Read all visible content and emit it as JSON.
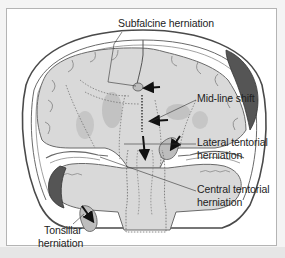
{
  "figure": {
    "type": "anatomical-diagram",
    "colors": {
      "panel_border": "#b4b4b4",
      "footer_band": "#e6e6e6",
      "brain_fill": "#d9d9d9",
      "brain_dark_fill": "#c2c2c2",
      "hematoma": "#555555",
      "outline": "#4a4a4a",
      "arrow": "#111111"
    }
  },
  "labels": {
    "subfalcine": "Subfalcine herniation",
    "midline": "Mid-line shift",
    "lateral_line1": "Lateral tentorial",
    "lateral_line2": "herniation",
    "central_line1": "Central tentorial",
    "central_line2": "herniation",
    "tonsillar_line1": "Tonsillar",
    "tonsillar_line2": "herniation"
  }
}
